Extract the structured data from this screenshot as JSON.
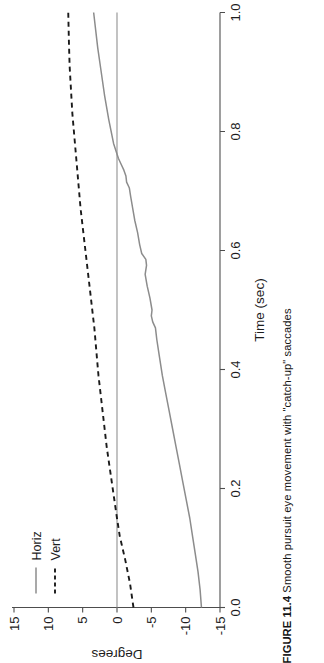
{
  "figure": {
    "caption_number": "FIGURE 11.4",
    "caption_text": "Smooth pursuit eye movement with \"catch-up\" saccades"
  },
  "chart_data": {
    "type": "line",
    "title": "",
    "xlabel": "Time (sec)",
    "ylabel": "Degrees",
    "xlim": [
      0.0,
      1.0
    ],
    "ylim": [
      -15,
      15
    ],
    "xticks": [
      0.0,
      0.2,
      0.4,
      0.6,
      0.8,
      1.0
    ],
    "xtick_labels": [
      "0.0",
      "0.2",
      "0.4",
      "0.6",
      "0.8",
      "1.0"
    ],
    "yticks": [
      15,
      10,
      5,
      0,
      -5,
      -10,
      -15
    ],
    "ytick_labels": [
      "15",
      "10",
      "5",
      "0",
      "-5",
      "-10",
      "-15"
    ],
    "grid": false,
    "reference_line_y": 0,
    "legend_position": "top-left",
    "legend": [
      {
        "name": "Horiz",
        "style": "solid"
      },
      {
        "name": "Vert",
        "style": "dashed"
      }
    ],
    "series": [
      {
        "name": "Horiz",
        "style": "solid",
        "color": "#8c8c8c",
        "x": [
          0.0,
          0.03,
          0.06,
          0.09,
          0.12,
          0.15,
          0.18,
          0.21,
          0.24,
          0.27,
          0.3,
          0.33,
          0.36,
          0.39,
          0.42,
          0.45,
          0.47,
          0.48,
          0.49,
          0.5,
          0.52,
          0.54,
          0.56,
          0.575,
          0.585,
          0.595,
          0.61,
          0.63,
          0.65,
          0.67,
          0.69,
          0.705,
          0.715,
          0.725,
          0.735,
          0.745,
          0.755,
          0.78,
          0.82,
          0.86,
          0.9,
          0.94,
          0.97,
          1.0
        ],
        "y": [
          -12.3,
          -12.1,
          -11.8,
          -11.4,
          -11.0,
          -10.6,
          -10.1,
          -9.6,
          -9.1,
          -8.6,
          -8.1,
          -7.6,
          -7.1,
          -6.6,
          -6.2,
          -5.8,
          -5.6,
          -5.2,
          -5.0,
          -5.1,
          -4.8,
          -4.4,
          -4.1,
          -4.3,
          -4.2,
          -3.6,
          -3.3,
          -3.0,
          -2.6,
          -2.3,
          -2.0,
          -1.8,
          -1.4,
          -1.3,
          -1.0,
          -0.6,
          -0.2,
          0.5,
          1.2,
          1.8,
          2.3,
          2.8,
          3.1,
          3.4
        ]
      },
      {
        "name": "Vert",
        "style": "dashed",
        "color": "#1a1a1a",
        "x": [
          0.0,
          0.04,
          0.08,
          0.12,
          0.15,
          0.19,
          0.23,
          0.27,
          0.31,
          0.35,
          0.39,
          0.43,
          0.47,
          0.51,
          0.55,
          0.59,
          0.63,
          0.67,
          0.71,
          0.75,
          0.79,
          0.83,
          0.87,
          0.91,
          0.95,
          1.0
        ],
        "y": [
          -2.4,
          -1.9,
          -1.2,
          -0.4,
          0.0,
          0.5,
          1.0,
          1.5,
          1.9,
          2.3,
          2.7,
          3.0,
          3.3,
          3.7,
          4.1,
          4.5,
          4.9,
          5.3,
          5.6,
          5.9,
          6.2,
          6.5,
          6.7,
          6.9,
          7.0,
          7.1
        ]
      }
    ]
  }
}
